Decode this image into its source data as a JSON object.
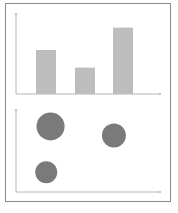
{
  "colors": {
    "frame": "#8a8a8a",
    "axis": "#b5b5b5",
    "bar": "#bdbdbd",
    "point": "#7a7a7a"
  },
  "chart_data": [
    {
      "type": "bar",
      "title": "",
      "xlabel": "",
      "ylabel": "",
      "categories": [
        "",
        "",
        ""
      ],
      "values": [
        55,
        33,
        83
      ],
      "ylim": [
        0,
        100
      ],
      "grid": false,
      "legend": null
    },
    {
      "type": "scatter",
      "title": "",
      "xlabel": "",
      "ylabel": "",
      "points": [
        {
          "x": 24,
          "y": 80,
          "size": 14
        },
        {
          "x": 68,
          "y": 69,
          "size": 12
        },
        {
          "x": 21,
          "y": 24,
          "size": 11
        }
      ],
      "xlim": [
        0,
        100
      ],
      "ylim": [
        0,
        100
      ],
      "grid": false,
      "legend": null
    }
  ]
}
